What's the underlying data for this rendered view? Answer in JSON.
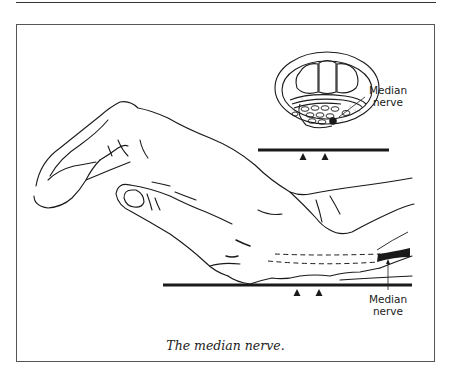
{
  "figure": {
    "caption": "The median nerve.",
    "labels": {
      "cross_section_label_line1": "Median",
      "cross_section_label_line2": "nerve",
      "hand_label_line1": "Median",
      "hand_label_line2": "nerve"
    },
    "elements": {
      "illustration": "hand-resting-on-surface",
      "inset": "wrist-cross-section-carpal-tunnel",
      "markers": "pressure-triangles"
    },
    "colors": {
      "line": "#1a1a1a",
      "frame": "#555555",
      "background": "#ffffff"
    }
  }
}
